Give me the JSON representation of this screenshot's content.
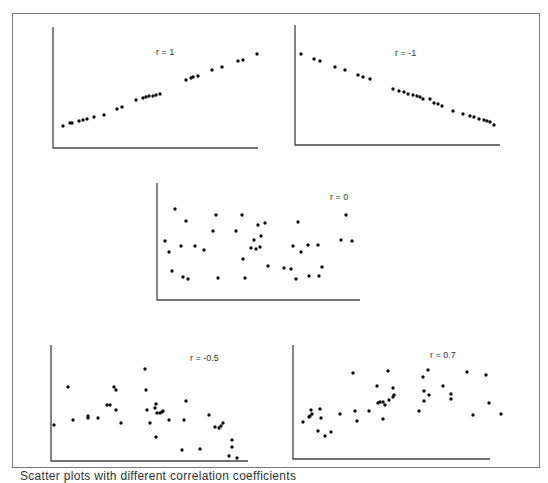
{
  "figure": {
    "caption": "Scatter plots with different correlation coefficients"
  },
  "chart_data": [
    {
      "type": "scatter",
      "title": "r = 1",
      "xlabel": "",
      "ylabel": "",
      "grid": false,
      "axis_px": {
        "x0": 53,
        "y0": 148,
        "x1": 258,
        "y1": 27
      },
      "points_px": [
        [
          63,
          126
        ],
        [
          70,
          123
        ],
        [
          72,
          123
        ],
        [
          79,
          121
        ],
        [
          83,
          120
        ],
        [
          87,
          119
        ],
        [
          94,
          117
        ],
        [
          104,
          115
        ],
        [
          117,
          109
        ],
        [
          122,
          107
        ],
        [
          136,
          100
        ],
        [
          143,
          98
        ],
        [
          146,
          97
        ],
        [
          149,
          96
        ],
        [
          153,
          96
        ],
        [
          156,
          95
        ],
        [
          160,
          94
        ],
        [
          186,
          80
        ],
        [
          191,
          78
        ],
        [
          193,
          77
        ],
        [
          198,
          76
        ],
        [
          212,
          70
        ],
        [
          222,
          67
        ],
        [
          238,
          61
        ],
        [
          243,
          60
        ],
        [
          257,
          54
        ]
      ],
      "label_px": [
        156,
        55
      ]
    },
    {
      "type": "scatter",
      "title": "r = -1",
      "xlabel": "",
      "ylabel": "",
      "grid": false,
      "axis_px": {
        "x0": 295,
        "y0": 145,
        "x1": 500,
        "y1": 25
      },
      "points_px": [
        [
          301,
          54
        ],
        [
          314,
          59
        ],
        [
          320,
          61
        ],
        [
          335,
          67
        ],
        [
          345,
          70
        ],
        [
          358,
          75
        ],
        [
          363,
          77
        ],
        [
          370,
          79
        ],
        [
          393,
          89
        ],
        [
          399,
          91
        ],
        [
          404,
          92
        ],
        [
          408,
          94
        ],
        [
          413,
          95
        ],
        [
          417,
          96
        ],
        [
          420,
          97
        ],
        [
          423,
          99
        ],
        [
          430,
          99
        ],
        [
          434,
          103
        ],
        [
          438,
          104
        ],
        [
          442,
          106
        ],
        [
          453,
          111
        ],
        [
          463,
          114
        ],
        [
          470,
          116
        ],
        [
          474,
          117
        ],
        [
          479,
          119
        ],
        [
          484,
          120
        ],
        [
          487,
          121
        ],
        [
          490,
          122
        ],
        [
          494,
          125
        ]
      ],
      "label_px": [
        395,
        56
      ]
    },
    {
      "type": "scatter",
      "title": "r = 0",
      "xlabel": "",
      "ylabel": "",
      "grid": false,
      "axis_px": {
        "x0": 157,
        "y0": 300,
        "x1": 360,
        "y1": 183
      },
      "points_px": [
        [
          175,
          209
        ],
        [
          186,
          221
        ],
        [
          216,
          215
        ],
        [
          213,
          231
        ],
        [
          169,
          252
        ],
        [
          165,
          241
        ],
        [
          181,
          246
        ],
        [
          195,
          246
        ],
        [
          172,
          271
        ],
        [
          183,
          277
        ],
        [
          188,
          279
        ],
        [
          204,
          250
        ],
        [
          218,
          278
        ],
        [
          242,
          215
        ],
        [
          236,
          231
        ],
        [
          245,
          278
        ],
        [
          254,
          240
        ],
        [
          243,
          259
        ],
        [
          265,
          223
        ],
        [
          251,
          248
        ],
        [
          256,
          249
        ],
        [
          260,
          247
        ],
        [
          258,
          225
        ],
        [
          261,
          236
        ],
        [
          268,
          266
        ],
        [
          298,
          222
        ],
        [
          293,
          246
        ],
        [
          284,
          268
        ],
        [
          291,
          269
        ],
        [
          296,
          279
        ],
        [
          301,
          252
        ],
        [
          318,
          245
        ],
        [
          309,
          276
        ],
        [
          319,
          276
        ],
        [
          346,
          215
        ],
        [
          341,
          240
        ],
        [
          352,
          241
        ],
        [
          322,
          267
        ],
        [
          308,
          245
        ]
      ],
      "label_px": [
        330,
        200
      ]
    },
    {
      "type": "scatter",
      "title": "r = -0.5",
      "xlabel": "",
      "ylabel": "",
      "grid": false,
      "axis_px": {
        "x0": 51,
        "y0": 461,
        "x1": 248,
        "y1": 345
      },
      "points_px": [
        [
          54,
          425
        ],
        [
          68,
          387
        ],
        [
          73,
          420
        ],
        [
          88,
          418
        ],
        [
          88,
          416
        ],
        [
          98,
          418
        ],
        [
          110,
          405
        ],
        [
          114,
          387
        ],
        [
          116,
          390
        ],
        [
          116,
          410
        ],
        [
          121,
          423
        ],
        [
          107,
          405
        ],
        [
          145,
          369
        ],
        [
          146,
          390
        ],
        [
          147,
          410
        ],
        [
          150,
          423
        ],
        [
          155,
          408
        ],
        [
          156,
          404
        ],
        [
          157,
          413
        ],
        [
          160,
          413
        ],
        [
          162,
          412
        ],
        [
          163,
          411
        ],
        [
          156,
          437
        ],
        [
          169,
          420
        ],
        [
          184,
          420
        ],
        [
          186,
          401
        ],
        [
          182,
          450
        ],
        [
          200,
          449
        ],
        [
          209,
          415
        ],
        [
          215,
          427
        ],
        [
          219,
          428
        ],
        [
          221,
          426
        ],
        [
          223,
          423
        ],
        [
          232,
          440
        ],
        [
          232,
          447
        ],
        [
          229,
          456
        ],
        [
          237,
          458
        ]
      ],
      "label_px": [
        190,
        361
      ]
    },
    {
      "type": "scatter",
      "title": "r = 0.7",
      "xlabel": "",
      "ylabel": "",
      "grid": false,
      "axis_px": {
        "x0": 293,
        "y0": 459,
        "x1": 490,
        "y1": 345
      },
      "points_px": [
        [
          303,
          422
        ],
        [
          309,
          417
        ],
        [
          310,
          416
        ],
        [
          312,
          414
        ],
        [
          311,
          410
        ],
        [
          320,
          409
        ],
        [
          321,
          418
        ],
        [
          318,
          431
        ],
        [
          325,
          436
        ],
        [
          331,
          432
        ],
        [
          340,
          414
        ],
        [
          353,
          373
        ],
        [
          355,
          411
        ],
        [
          357,
          421
        ],
        [
          369,
          411
        ],
        [
          377,
          386
        ],
        [
          378,
          403
        ],
        [
          380,
          402
        ],
        [
          383,
          402
        ],
        [
          383,
          419
        ],
        [
          385,
          405
        ],
        [
          388,
          371
        ],
        [
          389,
          400
        ],
        [
          393,
          397
        ],
        [
          394,
          395
        ],
        [
          393,
          388
        ],
        [
          419,
          411
        ],
        [
          423,
          377
        ],
        [
          424,
          391
        ],
        [
          424,
          401
        ],
        [
          428,
          370
        ],
        [
          429,
          395
        ],
        [
          443,
          386
        ],
        [
          451,
          394
        ],
        [
          451,
          399
        ],
        [
          467,
          372
        ],
        [
          473,
          415
        ],
        [
          486,
          375
        ],
        [
          489,
          403
        ],
        [
          501,
          414
        ]
      ],
      "label_px": [
        430,
        358
      ]
    }
  ]
}
